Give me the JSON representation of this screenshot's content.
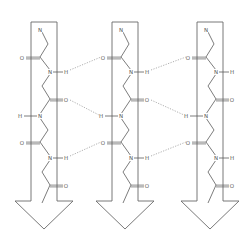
{
  "strands": [
    {
      "id": "strand-1",
      "direction": "down",
      "x": 44,
      "atoms": [
        {
          "label": "N",
          "x": 40,
          "y": 30
        },
        {
          "label": "O",
          "x": 22,
          "y": 58
        },
        {
          "label": "N",
          "x": 50,
          "y": 72
        },
        {
          "label": "H",
          "x": 66,
          "y": 72
        },
        {
          "label": "O",
          "x": 66,
          "y": 100
        },
        {
          "label": "H",
          "x": 20,
          "y": 116
        },
        {
          "label": "N",
          "x": 40,
          "y": 116
        },
        {
          "label": "O",
          "x": 22,
          "y": 143
        },
        {
          "label": "N",
          "x": 50,
          "y": 158
        },
        {
          "label": "H",
          "x": 66,
          "y": 158
        },
        {
          "label": "O",
          "x": 66,
          "y": 186
        }
      ]
    },
    {
      "id": "strand-2",
      "direction": "down",
      "x": 125,
      "atoms": [
        {
          "label": "N",
          "x": 121,
          "y": 30
        },
        {
          "label": "O",
          "x": 103,
          "y": 58
        },
        {
          "label": "N",
          "x": 131,
          "y": 72
        },
        {
          "label": "H",
          "x": 147,
          "y": 72
        },
        {
          "label": "O",
          "x": 147,
          "y": 100
        },
        {
          "label": "H",
          "x": 101,
          "y": 116
        },
        {
          "label": "N",
          "x": 121,
          "y": 116
        },
        {
          "label": "O",
          "x": 103,
          "y": 143
        },
        {
          "label": "N",
          "x": 131,
          "y": 158
        },
        {
          "label": "H",
          "x": 147,
          "y": 158
        },
        {
          "label": "O",
          "x": 147,
          "y": 186
        }
      ]
    },
    {
      "id": "strand-3",
      "direction": "down",
      "x": 210,
      "atoms": [
        {
          "label": "N",
          "x": 206,
          "y": 30
        },
        {
          "label": "O",
          "x": 188,
          "y": 58
        },
        {
          "label": "N",
          "x": 216,
          "y": 72
        },
        {
          "label": "H",
          "x": 232,
          "y": 72
        },
        {
          "label": "O",
          "x": 232,
          "y": 100
        },
        {
          "label": "H",
          "x": 186,
          "y": 116
        },
        {
          "label": "N",
          "x": 206,
          "y": 116
        },
        {
          "label": "O",
          "x": 188,
          "y": 143
        },
        {
          "label": "N",
          "x": 216,
          "y": 158
        },
        {
          "label": "H",
          "x": 232,
          "y": 158
        },
        {
          "label": "O",
          "x": 232,
          "y": 186
        }
      ]
    }
  ],
  "hydrogen_bonds": [
    {
      "from": "strand-1 H",
      "to": "strand-2 O",
      "x1": 70,
      "y1": 70,
      "x2": 101,
      "y2": 57
    },
    {
      "from": "strand-1 O",
      "to": "strand-2 H",
      "x1": 70,
      "y1": 100,
      "x2": 99,
      "y2": 115
    },
    {
      "from": "strand-1 H",
      "to": "strand-2 O",
      "x1": 70,
      "y1": 156,
      "x2": 101,
      "y2": 142
    },
    {
      "from": "strand-2 H",
      "to": "strand-3 O",
      "x1": 151,
      "y1": 70,
      "x2": 186,
      "y2": 57
    },
    {
      "from": "strand-2 O",
      "to": "strand-3 H",
      "x1": 151,
      "y1": 100,
      "x2": 184,
      "y2": 115
    },
    {
      "from": "strand-2 H",
      "to": "strand-3 O",
      "x1": 151,
      "y1": 156,
      "x2": 186,
      "y2": 142
    }
  ]
}
